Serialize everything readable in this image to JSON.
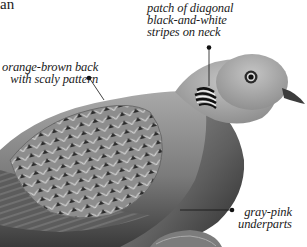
{
  "title_fragment": "an",
  "annotations": [
    {
      "id": "neck-stripes",
      "lines": [
        "patch of diagonal",
        "black-and-white",
        "stripes on neck"
      ]
    },
    {
      "id": "back",
      "lines": [
        "orange-brown back",
        "with scaly pattern"
      ]
    },
    {
      "id": "underparts",
      "lines": [
        "gray-pink",
        "underparts"
      ]
    }
  ],
  "colors": {
    "background": "#ffffff",
    "text": "#1a1a1a",
    "leader_line": "#111111",
    "plumage_light": "#b9b9b9",
    "plumage_mid": "#8a8a8a",
    "plumage_dark": "#3e3e3e"
  }
}
